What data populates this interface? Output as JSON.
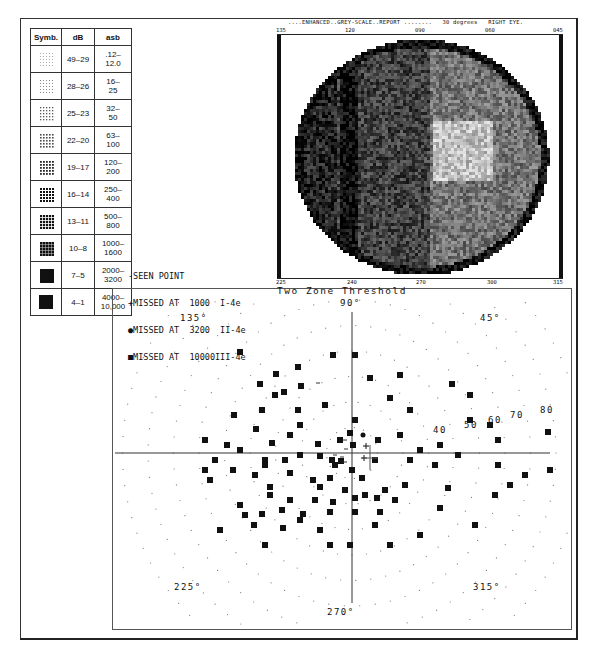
{
  "legend_table": {
    "headers": [
      "Symb.",
      "dB",
      "asb"
    ],
    "rows": [
      {
        "symbol": "dots-sparse",
        "db": "49–29",
        "asb": ".12–\n12.0"
      },
      {
        "symbol": "dots-grid-light",
        "db": "28–26",
        "asb": "16–\n25"
      },
      {
        "symbol": "dots-grid-medium",
        "db": "25–23",
        "asb": "32–\n50"
      },
      {
        "symbol": "grid-light",
        "db": "22–20",
        "asb": "63–\n100"
      },
      {
        "symbol": "grid-medium",
        "db": "19–17",
        "asb": "120–\n200"
      },
      {
        "symbol": "grid-dense",
        "db": "16–14",
        "asb": "250–\n400"
      },
      {
        "symbol": "grid-denser",
        "db": "13–11",
        "asb": "500–\n800"
      },
      {
        "symbol": "grid-dark",
        "db": "10–8",
        "asb": "1000–\n1600"
      },
      {
        "symbol": "hash-dark",
        "db": "7–5",
        "asb": "2000–\n3200"
      },
      {
        "symbol": "solid-black",
        "db": "4–1",
        "asb": "4000–\n10,000"
      }
    ]
  },
  "greyscale": {
    "header": "....ENHANCED..GREY-SCALE..REPORT ........   30 degrees   RIGHT EYE.",
    "top_ticks": [
      "135",
      "120",
      "090",
      "060",
      "045"
    ],
    "bottom_ticks": [
      "225",
      "240",
      "270",
      "300",
      "315"
    ]
  },
  "seen_legend": {
    "lines": [
      "-SEEN POINT",
      "+MISSED AT  1000  I-4e",
      "●MISSED AT  3200  II-4e",
      "■MISSED AT  10000III-4e"
    ]
  },
  "chart_data": {
    "type": "scatter",
    "title": "Two Zone Threshold",
    "subtitle": "Polar visual field plot, right eye",
    "angle_labels": [
      "90°",
      "45°",
      "135°",
      "225°",
      "270°",
      "315°"
    ],
    "radial_labels": [
      "40",
      "50",
      "60",
      "70",
      "80"
    ],
    "radial_unit": "degrees",
    "grid": "concentric dotted circles every 10°",
    "legend": [
      "-SEEN POINT",
      "+MISSED AT 1000 I-4e",
      "●MISSED AT 3200 II-4e",
      "■MISSED AT 10000 III-4e"
    ],
    "center_px": [
      352,
      453
    ],
    "px_per_10deg": 25.5,
    "missed_10000_points_px": [
      [
        333,
        355
      ],
      [
        355,
        355
      ],
      [
        298,
        367
      ],
      [
        276,
        374
      ],
      [
        260,
        384
      ],
      [
        400,
        375
      ],
      [
        452,
        384
      ],
      [
        275,
        395
      ],
      [
        325,
        405
      ],
      [
        390,
        398
      ],
      [
        298,
        410
      ],
      [
        262,
        410
      ],
      [
        410,
        410
      ],
      [
        300,
        425
      ],
      [
        355,
        420
      ],
      [
        370,
        378
      ],
      [
        290,
        435
      ],
      [
        350,
        433
      ],
      [
        353,
        445
      ],
      [
        272,
        443
      ],
      [
        318,
        444
      ],
      [
        340,
        440
      ],
      [
        378,
        440
      ],
      [
        400,
        435
      ],
      [
        420,
        450
      ],
      [
        440,
        445
      ],
      [
        458,
        455
      ],
      [
        490,
        425
      ],
      [
        234,
        415
      ],
      [
        256,
        429
      ],
      [
        227,
        445
      ],
      [
        205,
        440
      ],
      [
        240,
        450
      ],
      [
        215,
        460
      ],
      [
        265,
        460
      ],
      [
        285,
        460
      ],
      [
        300,
        455
      ],
      [
        320,
        456
      ],
      [
        332,
        460
      ],
      [
        341,
        461
      ],
      [
        375,
        460
      ],
      [
        410,
        460
      ],
      [
        265,
        465
      ],
      [
        233,
        470
      ],
      [
        255,
        475
      ],
      [
        290,
        473
      ],
      [
        313,
        480
      ],
      [
        330,
        478
      ],
      [
        335,
        465
      ],
      [
        352,
        470
      ],
      [
        362,
        478
      ],
      [
        270,
        487
      ],
      [
        320,
        487
      ],
      [
        345,
        490
      ],
      [
        365,
        495
      ],
      [
        385,
        490
      ],
      [
        405,
        485
      ],
      [
        435,
        465
      ],
      [
        270,
        495
      ],
      [
        210,
        480
      ],
      [
        290,
        500
      ],
      [
        315,
        500
      ],
      [
        333,
        502
      ],
      [
        355,
        498
      ],
      [
        377,
        498
      ],
      [
        395,
        500
      ],
      [
        448,
        488
      ],
      [
        240,
        505
      ],
      [
        262,
        514
      ],
      [
        282,
        510
      ],
      [
        303,
        514
      ],
      [
        330,
        512
      ],
      [
        355,
        512
      ],
      [
        380,
        512
      ],
      [
        245,
        515
      ],
      [
        300,
        520
      ],
      [
        320,
        530
      ],
      [
        375,
        525
      ],
      [
        390,
        545
      ],
      [
        265,
        545
      ],
      [
        254,
        525
      ],
      [
        220,
        530
      ],
      [
        283,
        528
      ],
      [
        420,
        535
      ],
      [
        330,
        545
      ],
      [
        350,
        545
      ],
      [
        495,
        495
      ],
      [
        510,
        485
      ],
      [
        525,
        475
      ],
      [
        498,
        465
      ],
      [
        548,
        432
      ],
      [
        550,
        470
      ],
      [
        498,
        440
      ],
      [
        440,
        508
      ],
      [
        470,
        420
      ],
      [
        470,
        395
      ],
      [
        475,
        525
      ],
      [
        205,
        470
      ],
      [
        240,
        352
      ],
      [
        284,
        392
      ],
      [
        301,
        386
      ]
    ],
    "missed_3200_points_px": [
      [
        363,
        435
      ]
    ],
    "missed_1000_points_px": [
      [
        366,
        446
      ],
      [
        364,
        458
      ]
    ],
    "seen_points_note": "dashes near center"
  }
}
